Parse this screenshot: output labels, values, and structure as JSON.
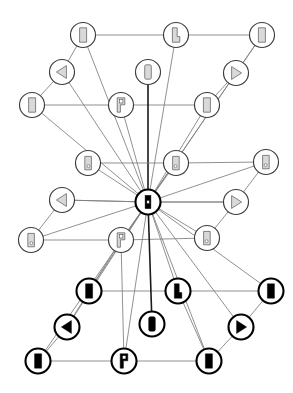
{
  "view": {
    "title": "Rotation Graph",
    "width": 293,
    "height": 393,
    "background": "#ffffff",
    "edge_color": "#7d7d7d",
    "edge_strong_color": "#1a1a1a",
    "node_stroke_light": "#3b3b3b",
    "node_stroke_dark": "#000000",
    "glyph_fill_light": "#d9d9d9",
    "glyph_fill_dark": "#000000"
  },
  "graph": {
    "node_radius": 12.5,
    "hub_id": "hub",
    "nodes": [
      {
        "id": "n01",
        "label": "n01",
        "x": 83,
        "y": 35,
        "style": "light",
        "glyph": "flag-shape-icon",
        "rot": 0,
        "mirror": false
      },
      {
        "id": "n02",
        "label": "n02",
        "x": 176,
        "y": 35,
        "style": "light",
        "glyph": "flag-corner-icon",
        "rot": 0,
        "mirror": false
      },
      {
        "id": "n03",
        "label": "n03",
        "x": 262,
        "y": 35,
        "style": "light",
        "glyph": "flag-shape-icon",
        "rot": 0,
        "mirror": true
      },
      {
        "id": "n04",
        "label": "n04",
        "x": 62,
        "y": 72,
        "style": "light",
        "glyph": "triangle-left-icon",
        "rot": 0,
        "mirror": false
      },
      {
        "id": "n05",
        "label": "n05",
        "x": 148,
        "y": 72,
        "style": "light",
        "glyph": "rounded-bar-icon",
        "rot": 0,
        "mirror": false
      },
      {
        "id": "n06",
        "label": "n06",
        "x": 236,
        "y": 73,
        "style": "light",
        "glyph": "triangle-right-icon",
        "rot": 0,
        "mirror": false
      },
      {
        "id": "n07",
        "label": "n07",
        "x": 32,
        "y": 105,
        "style": "light",
        "glyph": "flag-shape-icon",
        "rot": 0,
        "mirror": false
      },
      {
        "id": "n08",
        "label": "n08",
        "x": 121,
        "y": 105,
        "style": "light",
        "glyph": "flag-p-icon",
        "rot": 0,
        "mirror": false
      },
      {
        "id": "n09",
        "label": "n09",
        "x": 207,
        "y": 105,
        "style": "light",
        "glyph": "flag-shape-icon",
        "rot": 0,
        "mirror": true
      },
      {
        "id": "n10",
        "label": "n10",
        "x": 88,
        "y": 163,
        "style": "light",
        "glyph": "tag-dot-icon",
        "rot": 0,
        "mirror": false
      },
      {
        "id": "n11",
        "label": "n11",
        "x": 176,
        "y": 163,
        "style": "light",
        "glyph": "tag-dot-icon",
        "rot": 0,
        "mirror": true
      },
      {
        "id": "n12",
        "label": "n12",
        "x": 266,
        "y": 162,
        "style": "light",
        "glyph": "tag-dot-icon",
        "rot": 0,
        "mirror": true
      },
      {
        "id": "n13",
        "label": "n13",
        "x": 62,
        "y": 200,
        "style": "light",
        "glyph": "triangle-left-icon",
        "rot": 0,
        "mirror": false
      },
      {
        "id": "hub",
        "label": "hub",
        "x": 148,
        "y": 202,
        "style": "dark",
        "glyph": "hub-bar-icon",
        "rot": 0,
        "mirror": false
      },
      {
        "id": "n14",
        "label": "n14",
        "x": 236,
        "y": 202,
        "style": "light",
        "glyph": "triangle-right-icon",
        "rot": 0,
        "mirror": false
      },
      {
        "id": "n15",
        "label": "n15",
        "x": 31,
        "y": 240,
        "style": "light",
        "glyph": "tag-dot-icon",
        "rot": 0,
        "mirror": false
      },
      {
        "id": "n16",
        "label": "n16",
        "x": 121,
        "y": 240,
        "style": "light",
        "glyph": "flag-p-icon",
        "rot": 0,
        "mirror": false
      },
      {
        "id": "n17",
        "label": "n17",
        "x": 207,
        "y": 238,
        "style": "light",
        "glyph": "tag-dot-icon",
        "rot": 0,
        "mirror": true
      },
      {
        "id": "n18",
        "label": "n18",
        "x": 89,
        "y": 291,
        "style": "dark",
        "glyph": "flag-shape-icon",
        "rot": 0,
        "mirror": false
      },
      {
        "id": "n19",
        "label": "n19",
        "x": 178,
        "y": 291,
        "style": "dark",
        "glyph": "flag-corner-icon",
        "rot": 0,
        "mirror": false
      },
      {
        "id": "n20",
        "label": "n20",
        "x": 271,
        "y": 291,
        "style": "dark",
        "glyph": "flag-shape-icon",
        "rot": 0,
        "mirror": true
      },
      {
        "id": "n21",
        "label": "n21",
        "x": 67,
        "y": 327,
        "style": "dark",
        "glyph": "triangle-left-icon",
        "rot": 0,
        "mirror": false
      },
      {
        "id": "n22",
        "label": "n22",
        "x": 152,
        "y": 324,
        "style": "dark",
        "glyph": "rounded-bar-icon",
        "rot": 0,
        "mirror": false
      },
      {
        "id": "n23",
        "label": "n23",
        "x": 241,
        "y": 327,
        "style": "dark",
        "glyph": "triangle-right-icon",
        "rot": 0,
        "mirror": false
      },
      {
        "id": "n24",
        "label": "n24",
        "x": 38,
        "y": 361,
        "style": "dark",
        "glyph": "flag-shape-icon",
        "rot": 0,
        "mirror": false
      },
      {
        "id": "n25",
        "label": "n25",
        "x": 124,
        "y": 361,
        "style": "dark",
        "glyph": "flag-p-icon",
        "rot": 0,
        "mirror": false
      },
      {
        "id": "n26",
        "label": "n26",
        "x": 209,
        "y": 361,
        "style": "dark",
        "glyph": "flag-shape-icon",
        "rot": 0,
        "mirror": true
      }
    ],
    "edges": [
      {
        "from": "n01",
        "to": "n02",
        "weight": "thin"
      },
      {
        "from": "n02",
        "to": "n03",
        "weight": "thin"
      },
      {
        "from": "n01",
        "to": "n04",
        "weight": "thin"
      },
      {
        "from": "n04",
        "to": "n07",
        "weight": "thin"
      },
      {
        "from": "n03",
        "to": "n06",
        "weight": "thin"
      },
      {
        "from": "n06",
        "to": "n09",
        "weight": "thin"
      },
      {
        "from": "n07",
        "to": "n08",
        "weight": "thin"
      },
      {
        "from": "n08",
        "to": "n09",
        "weight": "thin"
      },
      {
        "from": "n05",
        "to": "hub",
        "weight": "strong"
      },
      {
        "from": "n10",
        "to": "n11",
        "weight": "thin"
      },
      {
        "from": "n11",
        "to": "n12",
        "weight": "thin"
      },
      {
        "from": "n13",
        "to": "hub",
        "weight": "thin"
      },
      {
        "from": "hub",
        "to": "n14",
        "weight": "thin"
      },
      {
        "from": "n15",
        "to": "n16",
        "weight": "thin"
      },
      {
        "from": "n16",
        "to": "n17",
        "weight": "thin"
      },
      {
        "from": "n13",
        "to": "n15",
        "weight": "thin"
      },
      {
        "from": "n12",
        "to": "n14",
        "weight": "thin"
      },
      {
        "from": "n14",
        "to": "n17",
        "weight": "thin"
      },
      {
        "from": "n18",
        "to": "n19",
        "weight": "thin"
      },
      {
        "from": "n19",
        "to": "n20",
        "weight": "thin"
      },
      {
        "from": "n18",
        "to": "n21",
        "weight": "thin"
      },
      {
        "from": "n21",
        "to": "n24",
        "weight": "thin"
      },
      {
        "from": "n20",
        "to": "n23",
        "weight": "thin"
      },
      {
        "from": "n23",
        "to": "n26",
        "weight": "thin"
      },
      {
        "from": "n24",
        "to": "n25",
        "weight": "thin"
      },
      {
        "from": "n25",
        "to": "n26",
        "weight": "thin"
      },
      {
        "from": "n16",
        "to": "n18",
        "weight": "thin"
      },
      {
        "from": "n16",
        "to": "n25",
        "weight": "thin"
      },
      {
        "from": "n19",
        "to": "n26",
        "weight": "thin"
      },
      {
        "from": "hub",
        "to": "n22",
        "weight": "strong"
      },
      {
        "from": "hub",
        "to": "n01",
        "weight": "thin"
      },
      {
        "from": "hub",
        "to": "n02",
        "weight": "thin"
      },
      {
        "from": "hub",
        "to": "n03",
        "weight": "thin"
      },
      {
        "from": "hub",
        "to": "n04",
        "weight": "thin"
      },
      {
        "from": "hub",
        "to": "n06",
        "weight": "thin"
      },
      {
        "from": "hub",
        "to": "n07",
        "weight": "thin"
      },
      {
        "from": "hub",
        "to": "n08",
        "weight": "thin"
      },
      {
        "from": "hub",
        "to": "n09",
        "weight": "thin"
      },
      {
        "from": "hub",
        "to": "n10",
        "weight": "thin"
      },
      {
        "from": "hub",
        "to": "n11",
        "weight": "thin"
      },
      {
        "from": "hub",
        "to": "n12",
        "weight": "thin"
      },
      {
        "from": "hub",
        "to": "n15",
        "weight": "thin"
      },
      {
        "from": "hub",
        "to": "n16",
        "weight": "thin"
      },
      {
        "from": "hub",
        "to": "n17",
        "weight": "thin"
      },
      {
        "from": "hub",
        "to": "n18",
        "weight": "thin"
      },
      {
        "from": "hub",
        "to": "n19",
        "weight": "thin"
      },
      {
        "from": "hub",
        "to": "n20",
        "weight": "thin"
      },
      {
        "from": "hub",
        "to": "n21",
        "weight": "thin"
      },
      {
        "from": "hub",
        "to": "n23",
        "weight": "thin"
      },
      {
        "from": "hub",
        "to": "n24",
        "weight": "thin"
      },
      {
        "from": "hub",
        "to": "n25",
        "weight": "thin"
      },
      {
        "from": "hub",
        "to": "n26",
        "weight": "thin"
      },
      {
        "from": "hub",
        "to": "n13",
        "weight": "thin"
      },
      {
        "from": "hub",
        "to": "n14",
        "weight": "thin"
      }
    ]
  }
}
